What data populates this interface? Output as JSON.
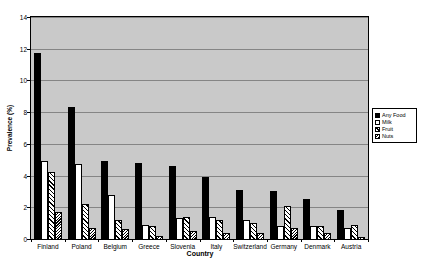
{
  "chart_data": {
    "type": "bar",
    "title": "",
    "xlabel": "Country",
    "ylabel": "Prevalence (%)",
    "ylim": [
      0,
      14
    ],
    "ytick_step": 2,
    "grid": true,
    "legend_position": "right",
    "categories": [
      "Finland",
      "Poland",
      "Belgium",
      "Greece",
      "Slovenia",
      "Italy",
      "Switzerland",
      "Germany",
      "Denmark",
      "Austria"
    ],
    "series": [
      {
        "name": "Any Food",
        "fill": "solid-black",
        "values": [
          11.7,
          8.3,
          4.9,
          4.8,
          4.6,
          3.9,
          3.1,
          3.0,
          2.5,
          1.8
        ]
      },
      {
        "name": "Milk",
        "fill": "white",
        "values": [
          4.9,
          4.7,
          2.8,
          0.9,
          1.3,
          1.4,
          1.2,
          0.8,
          0.8,
          0.7
        ]
      },
      {
        "name": "Fruit",
        "fill": "hatch-back",
        "values": [
          4.2,
          2.2,
          1.2,
          0.8,
          1.4,
          1.2,
          1.0,
          2.1,
          0.8,
          0.9
        ]
      },
      {
        "name": "Nuts",
        "fill": "hatch-fine",
        "values": [
          1.7,
          0.7,
          0.6,
          0.2,
          0.5,
          0.4,
          0.4,
          0.7,
          0.4,
          0.1
        ]
      }
    ]
  },
  "colors": {
    "page_bg": "#ffffff",
    "plot_bg": "#c9c9c9",
    "gridline": "#858585",
    "axis": "#000000",
    "bar_black": "#000000",
    "bar_white": "#ffffff",
    "hatch_line": "#000000"
  }
}
